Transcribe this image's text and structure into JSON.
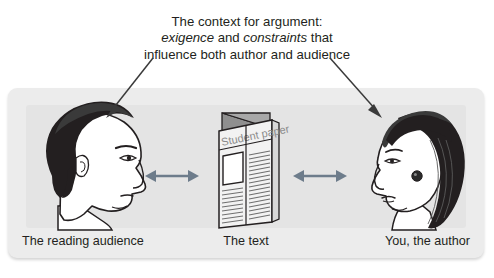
{
  "caption": {
    "line1": "The context for argument:",
    "line2_italic_a": "exigence",
    "line2_plain_a": " and ",
    "line2_italic_b": "constraints",
    "line2_plain_b": " that",
    "line3": "influence both author and audience"
  },
  "diagram": {
    "left_label": "The reading audience",
    "center_label": "The text",
    "right_label": "You, the author",
    "paper_title": "Student paper",
    "left_figure_name": "male-profile-facing-right",
    "center_figure_name": "folded-student-paper",
    "right_figure_name": "female-profile-facing-left",
    "arrow_left_name": "double-headed-arrow-audience-to-text",
    "arrow_right_name": "double-headed-arrow-text-to-author",
    "annotation_arrow_left_name": "annotation-arrow-to-audience",
    "annotation_arrow_right_name": "annotation-arrow-to-author"
  },
  "colors": {
    "text": "#231f20",
    "panel_background": "#ececec",
    "panel_inner_background": "#e4e4e4",
    "relation_arrow": "#6d7c8b",
    "annotation_arrow": "#3a3a3a",
    "figure_hair": "#231f20",
    "figure_skin": "#ffffff",
    "paper_gray": "#9a9a9a"
  }
}
